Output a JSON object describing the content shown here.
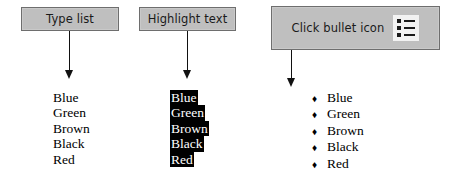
{
  "diagram": {
    "steps": [
      {
        "id": "type-list",
        "label": "Type list",
        "icon": null
      },
      {
        "id": "highlight-text",
        "label": "Highlight text",
        "icon": null
      },
      {
        "id": "click-bullet-icon",
        "label": "Click bullet icon",
        "icon": "bullet-list-icon"
      }
    ],
    "arrows": [
      {
        "id": "arrow-step-1",
        "direction": "down"
      },
      {
        "id": "arrow-step-2",
        "direction": "down"
      },
      {
        "id": "arrow-step-3",
        "direction": "down"
      }
    ],
    "lists": [
      {
        "id": "plain-list",
        "style": "plain",
        "items": [
          "Blue",
          "Green",
          "Brown",
          "Black",
          "Red"
        ]
      },
      {
        "id": "highlighted-list",
        "style": "highlighted",
        "items": [
          "Blue",
          "Green",
          "Brown",
          "Black",
          "Red"
        ]
      },
      {
        "id": "bulleted-list",
        "style": "bulleted",
        "bullet_glyph": "♦",
        "items": [
          "Blue",
          "Green",
          "Brown",
          "Black",
          "Red"
        ]
      }
    ]
  },
  "colors": {
    "box_fill": "#bfbfbf",
    "box_border": "#6e6e6e",
    "highlight_background": "#000000",
    "highlight_text": "#ffffff",
    "icon_background": "#f2f2f2",
    "text": "#000000",
    "page_background": "#ffffff"
  }
}
